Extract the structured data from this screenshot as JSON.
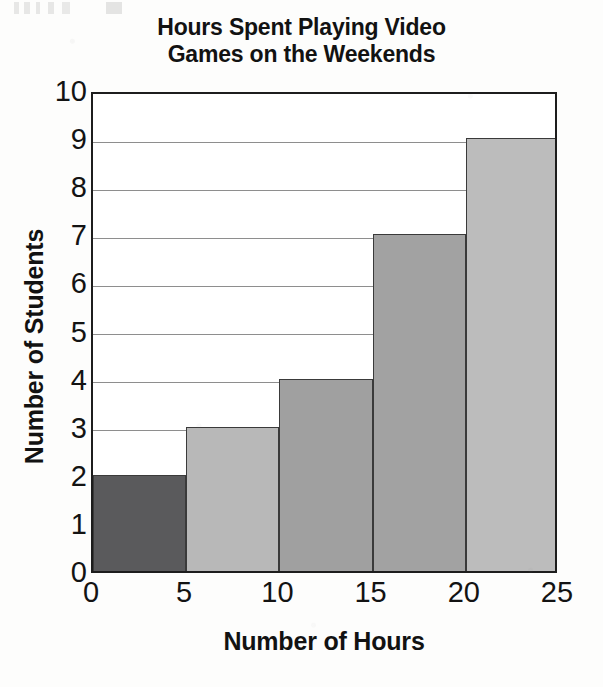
{
  "chart_data": {
    "type": "bar",
    "title": "Hours Spent Playing Video Games on the Weekends",
    "title_line1": "Hours Spent Playing Video",
    "title_line2": "Games on the Weekends",
    "xlabel": "Number of Hours",
    "ylabel": "Number of Students",
    "xlim": [
      0,
      25
    ],
    "ylim": [
      0,
      10
    ],
    "grid": "horizontal",
    "legend": "none",
    "bin_width": 5,
    "categories": [
      "0-5",
      "5-10",
      "10-15",
      "15-20",
      "20-25"
    ],
    "bin_edges": [
      0,
      5,
      10,
      15,
      20,
      25
    ],
    "values": [
      2,
      3,
      4,
      7,
      9
    ],
    "bar_colors": [
      "#5a5a5c",
      "#b8b8b8",
      "#a0a0a0",
      "#a2a2a2",
      "#bcbcbc"
    ],
    "bar_border_color": "#3a3a3a",
    "xticks": [
      "0",
      "5",
      "10",
      "15",
      "20",
      "25"
    ],
    "xtick_values": [
      0,
      5,
      10,
      15,
      20,
      25
    ],
    "yticks": [
      "0",
      "1",
      "2",
      "3",
      "4",
      "5",
      "6",
      "7",
      "8",
      "9",
      "10"
    ],
    "ytick_values": [
      0,
      1,
      2,
      3,
      4,
      5,
      6,
      7,
      8,
      9,
      10
    ],
    "axis_color": "#1d1d1d",
    "gridline_color": "#8e8e8e",
    "plot_background": "#ffffff"
  }
}
